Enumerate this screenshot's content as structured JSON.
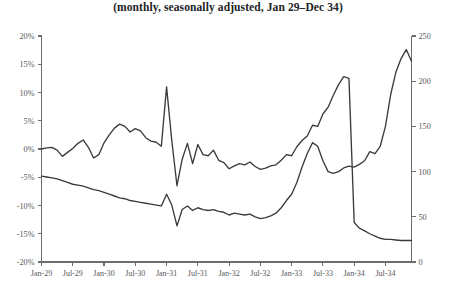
{
  "chart_data": {
    "type": "line",
    "title": "(monthly, seasonally adjusted, Jan 29–Dec 34)",
    "xlabel": "",
    "ylabel": "",
    "grid": false,
    "legend": "none",
    "x_tick_labels": [
      "Jan-29",
      "Jul-29",
      "Jan-30",
      "Jul-30",
      "Jan-31",
      "Jul-31",
      "Jan-32",
      "Jul-32",
      "Jan-33",
      "Jul-33",
      "Jan-34",
      "Jul-34"
    ],
    "x_range": [
      "Jan-29",
      "Dec-34"
    ],
    "left_axis": {
      "ticks": [
        "20%",
        "15%",
        "10%",
        "5%",
        "0%",
        "-5%",
        "-10%",
        "-15%",
        "-20%"
      ],
      "values": [
        20,
        15,
        10,
        5,
        0,
        -5,
        -10,
        -15,
        -20
      ],
      "ylim": [
        -20,
        20
      ],
      "unit": "%"
    },
    "right_axis": {
      "ticks": [
        "250",
        "200",
        "150",
        "100",
        "50",
        "0"
      ],
      "values": [
        250,
        200,
        150,
        100,
        50,
        0
      ],
      "ylim": [
        0,
        250
      ],
      "unit": ""
    },
    "series": [
      {
        "name": "percent-change-series",
        "axis": "left",
        "x": [
          "Jan-29",
          "Feb-29",
          "Mar-29",
          "Apr-29",
          "May-29",
          "Jun-29",
          "Jul-29",
          "Aug-29",
          "Sep-29",
          "Oct-29",
          "Nov-29",
          "Dec-29",
          "Jan-30",
          "Feb-30",
          "Mar-30",
          "Apr-30",
          "May-30",
          "Jun-30",
          "Jul-30",
          "Aug-30",
          "Sep-30",
          "Oct-30",
          "Nov-30",
          "Dec-30",
          "Jan-31",
          "Feb-31",
          "Mar-31",
          "Apr-31",
          "May-31",
          "Jun-31",
          "Jul-31",
          "Aug-31",
          "Sep-31",
          "Oct-31",
          "Nov-31",
          "Dec-31",
          "Jan-32",
          "Feb-32",
          "Mar-32",
          "Apr-32",
          "May-32",
          "Jun-32",
          "Jul-32",
          "Aug-32",
          "Sep-32",
          "Oct-32",
          "Nov-32",
          "Dec-32",
          "Jan-33",
          "Feb-33",
          "Mar-33",
          "Apr-33",
          "May-33",
          "Jun-33",
          "Jul-33",
          "Aug-33",
          "Sep-33",
          "Oct-33",
          "Nov-33",
          "Dec-33",
          "Jan-34",
          "Feb-34",
          "Mar-34",
          "Apr-34",
          "May-34",
          "Jun-34",
          "Jul-34",
          "Aug-34",
          "Sep-34",
          "Oct-34",
          "Nov-34",
          "Dec-34"
        ],
        "values": [
          0.0,
          0.2,
          0.3,
          -0.2,
          -1.3,
          -0.6,
          0.1,
          1.0,
          1.6,
          0.3,
          -1.6,
          -1.0,
          1.1,
          2.5,
          3.7,
          4.4,
          4.0,
          3.0,
          3.6,
          3.2,
          2.0,
          1.4,
          1.2,
          0.5,
          11.0,
          1.5,
          -6.5,
          -1.8,
          1.0,
          -2.6,
          0.8,
          -1.0,
          -1.2,
          -0.2,
          -2.0,
          -2.4,
          -3.5,
          -3.0,
          -2.6,
          -2.8,
          -2.3,
          -3.1,
          -3.6,
          -3.4,
          -3.0,
          -2.8,
          -2.0,
          -1.0,
          -1.2,
          0.4,
          1.5,
          2.3,
          4.2,
          4.0,
          6.2,
          7.4,
          9.5,
          11.4,
          12.8,
          12.5,
          -13.0,
          -14.0,
          -14.5,
          -15.0,
          -15.4,
          -15.8,
          -16.0,
          -16.0,
          -16.1,
          -16.2,
          -16.2,
          -16.2
        ]
      },
      {
        "name": "index-level-series",
        "axis": "right",
        "x": [
          "Jan-29",
          "Feb-29",
          "Mar-29",
          "Apr-29",
          "May-29",
          "Jun-29",
          "Jul-29",
          "Aug-29",
          "Sep-29",
          "Oct-29",
          "Nov-29",
          "Dec-29",
          "Jan-30",
          "Feb-30",
          "Mar-30",
          "Apr-30",
          "May-30",
          "Jun-30",
          "Jul-30",
          "Aug-30",
          "Sep-30",
          "Oct-30",
          "Nov-30",
          "Dec-30",
          "Jan-31",
          "Feb-31",
          "Mar-31",
          "Apr-31",
          "May-31",
          "Jun-31",
          "Jul-31",
          "Aug-31",
          "Sep-31",
          "Oct-31",
          "Nov-31",
          "Dec-31",
          "Jan-32",
          "Feb-32",
          "Mar-32",
          "Apr-32",
          "May-32",
          "Jun-32",
          "Jul-32",
          "Aug-32",
          "Sep-32",
          "Oct-32",
          "Nov-32",
          "Dec-32",
          "Jan-33",
          "Feb-33",
          "Mar-33",
          "Apr-33",
          "May-33",
          "Jun-33",
          "Jul-33",
          "Aug-33",
          "Sep-33",
          "Oct-33",
          "Nov-33",
          "Dec-33",
          "Jan-34",
          "Feb-34",
          "Mar-34",
          "Apr-34",
          "May-34",
          "Jun-34",
          "Jul-34",
          "Aug-34",
          "Sep-34",
          "Oct-34",
          "Nov-34",
          "Dec-34"
        ],
        "values": [
          95,
          94,
          93,
          92,
          90,
          88,
          86,
          85,
          84,
          82,
          80,
          79,
          77,
          75,
          73,
          71,
          70,
          68,
          67,
          66,
          65,
          64,
          63,
          62,
          75,
          63,
          40,
          58,
          62,
          57,
          60,
          58,
          57,
          58,
          56,
          55,
          52,
          54,
          53,
          52,
          53,
          50,
          48,
          49,
          51,
          54,
          60,
          68,
          75,
          88,
          105,
          120,
          132,
          128,
          112,
          100,
          98,
          100,
          104,
          106,
          105,
          108,
          112,
          122,
          120,
          128,
          150,
          185,
          210,
          225,
          235,
          222
        ]
      }
    ]
  }
}
